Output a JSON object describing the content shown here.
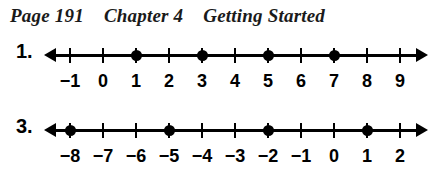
{
  "header": {
    "page": "Page 191",
    "chapter": "Chapter 4",
    "section": "Getting Started"
  },
  "geometry": {
    "first_tick_x": 70,
    "tick_spacing": 33,
    "axis_left": 52,
    "axis_width": 370
  },
  "problems": [
    {
      "number": "1.",
      "ticks": [
        "-1",
        "0",
        "1",
        "2",
        "3",
        "4",
        "5",
        "6",
        "7",
        "8",
        "9"
      ],
      "labels": [
        "−1",
        "0",
        "1",
        "2",
        "3",
        "4",
        "5",
        "6",
        "7",
        "8",
        "9"
      ],
      "dots": [
        "1",
        "3",
        "5",
        "7"
      ],
      "range": [
        -1,
        9
      ],
      "arrow_left": true,
      "arrow_right": true
    },
    {
      "number": "3.",
      "ticks": [
        "-8",
        "-7",
        "-6",
        "-5",
        "-4",
        "-3",
        "-2",
        "-1",
        "0",
        "1",
        "2"
      ],
      "labels": [
        "−8",
        "−7",
        "−6",
        "−5",
        "−4",
        "−3",
        "−2",
        "−1",
        "0",
        "1",
        "2"
      ],
      "dots": [
        "-8",
        "-5",
        "-2",
        "1"
      ],
      "range": [
        -8,
        2
      ],
      "arrow_left": true,
      "arrow_right": true
    }
  ],
  "colors": {
    "ink": "#000000",
    "paper": "#ffffff",
    "header_ink": "#1a1a1a"
  }
}
